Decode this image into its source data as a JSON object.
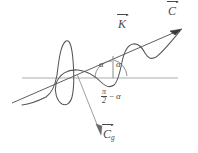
{
  "figure": {
    "stroke_color": "#555555",
    "axis_color": "#9a9a9a",
    "background": "#ffffff",
    "labels": {
      "wavevector": "K",
      "velocity": "C",
      "group_velocity": "C",
      "group_velocity_subscript": "g",
      "angle_left": "α",
      "angle_right": "α",
      "complement_numerator": "π",
      "complement_denominator": "2",
      "complement_operator": "−",
      "complement_angle": "α"
    },
    "elements": [
      "sine-wave-curve",
      "horizontal-axis-line",
      "slanted-vector-line-with-arrow",
      "downward-vector-line-with-arrow",
      "angle-arc-left",
      "angle-arc-right",
      "angle-vertical-tick"
    ]
  }
}
